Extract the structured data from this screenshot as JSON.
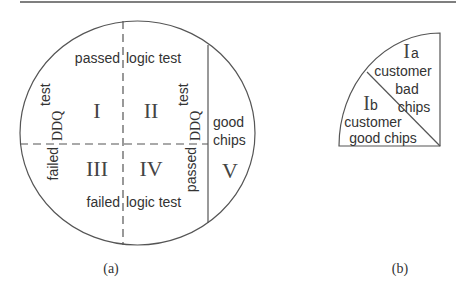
{
  "figure": {
    "panel_a": {
      "caption": "(a)",
      "top_label_left": "passed",
      "top_label_right": "logic test",
      "bottom_label_left": "failed",
      "bottom_label_right": "logic test",
      "left_vertical": {
        "result": "failed",
        "test": "DDQ",
        "suffix": "test"
      },
      "right_vertical": {
        "result": "passed",
        "test": "DDQ",
        "suffix": "test"
      },
      "regions": {
        "I": "I",
        "II": "II",
        "III": "III",
        "IV": "IV",
        "V": "V"
      },
      "good_chips_line1": "good",
      "good_chips_line2": "chips"
    },
    "panel_b": {
      "caption": "(b)",
      "upper_region": {
        "numeral": "I",
        "subscript": "a",
        "line1": "customer",
        "line2": "bad",
        "line3": "chips"
      },
      "lower_region": {
        "numeral": "I",
        "subscript": "b",
        "line1": "customer",
        "line2": "good chips"
      }
    }
  },
  "colors": {
    "line": "#555555",
    "text": "#333333",
    "background": "#ffffff"
  }
}
